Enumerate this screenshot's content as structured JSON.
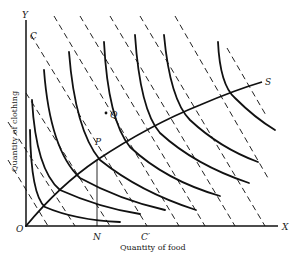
{
  "diagram": {
    "axes": {
      "y_label": "Y",
      "x_label": "X",
      "origin_label": "O",
      "y_title": "Quantity of clothing",
      "x_title": "Quantity of food"
    },
    "points": {
      "C": "C",
      "C_prime": "C′",
      "N": "N",
      "P": "P",
      "Q": "Q",
      "S": "S"
    },
    "elements": {
      "indifference_curves": 8,
      "budget_lines": 9,
      "expansion_path": "O–P–S"
    },
    "colors": {
      "ink": "#111111",
      "background": "#ffffff"
    }
  }
}
